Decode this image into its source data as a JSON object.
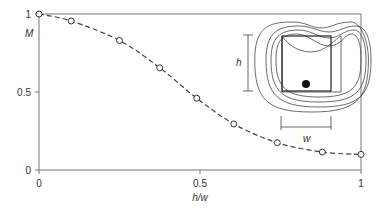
{
  "chart_data": {
    "type": "line",
    "title": "",
    "xlabel": "h/w",
    "ylabel": "M",
    "xlim": [
      0,
      1
    ],
    "ylim": [
      0,
      1
    ],
    "x_ticks": [
      "0",
      "0.5",
      "1"
    ],
    "y_ticks": [
      "0",
      "0.5",
      "1"
    ],
    "grid": false,
    "series": [
      {
        "name": "M vs h/w",
        "style": "dashed line with open circle markers",
        "x": [
          0,
          0.1,
          0.25,
          0.375,
          0.49,
          0.605,
          0.74,
          0.88,
          1.0
        ],
        "y": [
          1.0,
          0.955,
          0.83,
          0.655,
          0.46,
          0.295,
          0.175,
          0.115,
          0.1
        ]
      }
    ],
    "inset": {
      "description": "Rectangular cavity of height h and width w with nested contour lines and a filled dot near the bottom",
      "labels": [
        "h",
        "w"
      ]
    }
  }
}
